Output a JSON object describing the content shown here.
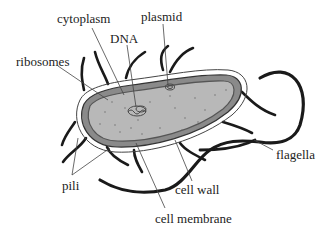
{
  "diagram": {
    "labels": [
      {
        "id": "cytoplasm",
        "text": "cytoplasm",
        "x": 57,
        "y": 12
      },
      {
        "id": "plasmid",
        "text": "plasmid",
        "x": 141,
        "y": 10
      },
      {
        "id": "dna",
        "text": "DNA",
        "x": 110,
        "y": 32
      },
      {
        "id": "ribosomes",
        "text": "ribosomes",
        "x": 16,
        "y": 55
      },
      {
        "id": "flagella",
        "text": "flagella",
        "x": 276,
        "y": 148
      },
      {
        "id": "pili",
        "text": "pili",
        "x": 62,
        "y": 179
      },
      {
        "id": "cell_wall",
        "text": "cell wall",
        "x": 175,
        "y": 183
      },
      {
        "id": "cell_membrane",
        "text": "cell membrane",
        "x": 155,
        "y": 212
      }
    ],
    "colors": {
      "cytoplasm_fill": "#b8b8b8",
      "membrane_stroke": "#555555",
      "wall_fill": "#8a8a8a",
      "capsule_stroke": "#444444",
      "appendage_stroke": "#1a1a1a",
      "leader_line": "#444444",
      "background": "#ffffff"
    }
  }
}
